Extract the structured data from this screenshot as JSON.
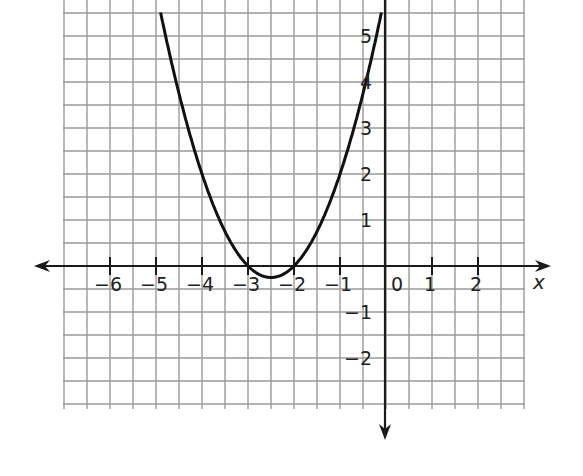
{
  "chart_data": {
    "type": "line",
    "title": "",
    "xlabel": "x",
    "ylabel": "",
    "function": "y = x^2 + 5x + 6",
    "xlim": [
      -7,
      3
    ],
    "ylim": [
      -3,
      5.8
    ],
    "grid": true,
    "grid_step": 0.5,
    "x_ticks": [
      -6,
      -5,
      -4,
      -3,
      -2,
      -1,
      0,
      1,
      2
    ],
    "x_tick_labels": [
      "−6",
      "−5",
      "−4",
      "−3",
      "−2",
      "−1",
      "0",
      "1",
      "2"
    ],
    "y_ticks": [
      -2,
      -1,
      1,
      2,
      3,
      4,
      5
    ],
    "y_tick_labels": [
      "−2",
      "−1",
      "1",
      "2",
      "3",
      "4",
      "5"
    ],
    "series": [
      {
        "name": "parabola",
        "x": [
          -4.9,
          -4.5,
          -4,
          -3.5,
          -3,
          -2.75,
          -2.5,
          -2.25,
          -2,
          -1.5,
          -1,
          -0.5,
          -0.1
        ],
        "y": [
          5.51,
          3.75,
          2,
          0.75,
          0,
          -0.1875,
          -0.25,
          -0.1875,
          0,
          0.75,
          2,
          3.75,
          5.51
        ]
      }
    ],
    "roots": [
      -3,
      -2
    ],
    "vertex": [
      -2.5,
      -0.25
    ]
  },
  "colors": {
    "grid": "#9a9a9a",
    "axis": "#1a1a1a",
    "curve": "#111111",
    "background": "#ffffff"
  }
}
